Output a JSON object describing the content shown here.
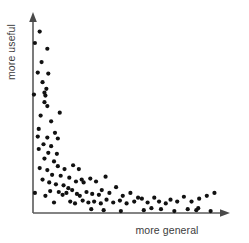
{
  "chart_data": {
    "type": "scatter",
    "title": "",
    "xlabel": "more general",
    "ylabel": "more useful",
    "xlim": [
      0,
      100
    ],
    "ylim": [
      0,
      100
    ],
    "grid": false,
    "legend": null,
    "axis_style": "arrow-axes-no-ticks",
    "point_color": "#111111",
    "axis_color": "#5a5a5a",
    "background_color": "#ffffff",
    "n_points": 101,
    "points": [
      {
        "x": 3.5,
        "y": 95.0
      },
      {
        "x": 1.0,
        "y": 89.0
      },
      {
        "x": 7.5,
        "y": 86.0
      },
      {
        "x": 4.5,
        "y": 79.0
      },
      {
        "x": 2.5,
        "y": 73.5
      },
      {
        "x": 8.0,
        "y": 73.0
      },
      {
        "x": 5.0,
        "y": 68.5
      },
      {
        "x": 7.0,
        "y": 65.0
      },
      {
        "x": 6.0,
        "y": 63.0
      },
      {
        "x": 6.5,
        "y": 61.5
      },
      {
        "x": 0.5,
        "y": 62.0
      },
      {
        "x": 6.0,
        "y": 58.0
      },
      {
        "x": 7.5,
        "y": 56.0
      },
      {
        "x": 4.0,
        "y": 51.0
      },
      {
        "x": 14.0,
        "y": 52.5
      },
      {
        "x": 9.5,
        "y": 48.0
      },
      {
        "x": 3.0,
        "y": 44.0
      },
      {
        "x": 11.5,
        "y": 42.0
      },
      {
        "x": 2.5,
        "y": 40.0
      },
      {
        "x": 7.5,
        "y": 39.5
      },
      {
        "x": 13.0,
        "y": 39.0
      },
      {
        "x": 5.5,
        "y": 36.0
      },
      {
        "x": 9.5,
        "y": 35.0
      },
      {
        "x": 3.0,
        "y": 33.5
      },
      {
        "x": 8.0,
        "y": 31.5
      },
      {
        "x": 12.5,
        "y": 31.0
      },
      {
        "x": 6.0,
        "y": 28.5
      },
      {
        "x": 11.0,
        "y": 27.0
      },
      {
        "x": 13.0,
        "y": 24.5
      },
      {
        "x": 3.5,
        "y": 23.5
      },
      {
        "x": 7.5,
        "y": 22.5
      },
      {
        "x": 16.5,
        "y": 23.0
      },
      {
        "x": 21.0,
        "y": 25.0
      },
      {
        "x": 24.0,
        "y": 23.0
      },
      {
        "x": 10.0,
        "y": 20.0
      },
      {
        "x": 14.5,
        "y": 19.5
      },
      {
        "x": 19.0,
        "y": 18.5
      },
      {
        "x": 5.0,
        "y": 17.5
      },
      {
        "x": 8.5,
        "y": 16.0
      },
      {
        "x": 12.0,
        "y": 15.0
      },
      {
        "x": 16.0,
        "y": 14.5
      },
      {
        "x": 22.5,
        "y": 16.5
      },
      {
        "x": 25.5,
        "y": 17.5
      },
      {
        "x": 26.5,
        "y": 16.0
      },
      {
        "x": 30.0,
        "y": 18.0
      },
      {
        "x": 33.0,
        "y": 16.5
      },
      {
        "x": 38.0,
        "y": 19.0
      },
      {
        "x": 18.5,
        "y": 13.0
      },
      {
        "x": 20.5,
        "y": 12.0
      },
      {
        "x": 9.0,
        "y": 11.5
      },
      {
        "x": 13.5,
        "y": 11.0
      },
      {
        "x": 1.0,
        "y": 10.5
      },
      {
        "x": 6.5,
        "y": 9.0
      },
      {
        "x": 15.5,
        "y": 9.5
      },
      {
        "x": 17.5,
        "y": 10.5
      },
      {
        "x": 23.0,
        "y": 10.0
      },
      {
        "x": 24.5,
        "y": 9.0
      },
      {
        "x": 28.0,
        "y": 11.0
      },
      {
        "x": 31.0,
        "y": 10.0
      },
      {
        "x": 34.5,
        "y": 9.5
      },
      {
        "x": 36.0,
        "y": 12.0
      },
      {
        "x": 40.0,
        "y": 10.5
      },
      {
        "x": 43.5,
        "y": 13.5
      },
      {
        "x": 47.0,
        "y": 9.0
      },
      {
        "x": 51.0,
        "y": 10.5
      },
      {
        "x": 55.0,
        "y": 8.0
      },
      {
        "x": 11.0,
        "y": 5.5
      },
      {
        "x": 19.5,
        "y": 6.0
      },
      {
        "x": 22.0,
        "y": 5.0
      },
      {
        "x": 26.0,
        "y": 6.5
      },
      {
        "x": 29.0,
        "y": 5.5
      },
      {
        "x": 32.0,
        "y": 6.0
      },
      {
        "x": 35.5,
        "y": 5.0
      },
      {
        "x": 38.5,
        "y": 7.0
      },
      {
        "x": 42.0,
        "y": 5.5
      },
      {
        "x": 45.5,
        "y": 6.5
      },
      {
        "x": 49.0,
        "y": 5.0
      },
      {
        "x": 53.0,
        "y": 6.0
      },
      {
        "x": 57.0,
        "y": 7.5
      },
      {
        "x": 60.0,
        "y": 5.5
      },
      {
        "x": 63.5,
        "y": 8.0
      },
      {
        "x": 66.0,
        "y": 6.0
      },
      {
        "x": 69.5,
        "y": 5.0
      },
      {
        "x": 72.0,
        "y": 7.0
      },
      {
        "x": 75.5,
        "y": 6.0
      },
      {
        "x": 79.0,
        "y": 8.5
      },
      {
        "x": 83.0,
        "y": 6.0
      },
      {
        "x": 87.0,
        "y": 7.5
      },
      {
        "x": 91.0,
        "y": 9.0
      },
      {
        "x": 95.0,
        "y": 10.5
      },
      {
        "x": 30.5,
        "y": 2.0
      },
      {
        "x": 37.0,
        "y": 1.5
      },
      {
        "x": 46.0,
        "y": 1.0
      },
      {
        "x": 58.0,
        "y": 1.5
      },
      {
        "x": 62.0,
        "y": 2.5
      },
      {
        "x": 67.0,
        "y": 2.0
      },
      {
        "x": 74.0,
        "y": 1.0
      },
      {
        "x": 81.0,
        "y": 2.0
      },
      {
        "x": 85.5,
        "y": 1.5
      },
      {
        "x": 86.5,
        "y": 2.5
      },
      {
        "x": 93.0,
        "y": 1.0
      }
    ]
  }
}
